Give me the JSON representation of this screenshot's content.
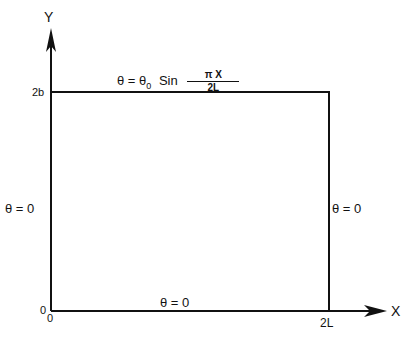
{
  "axes": {
    "x_label": "X",
    "y_label": "Y",
    "origin_label_x": "0",
    "origin_label_y": "0",
    "x_tick": "2L",
    "y_tick": "2b"
  },
  "boundary_conditions": {
    "top_lhs": "θ = θ",
    "top_lhs_sub": "0",
    "top_func": "Sin",
    "top_num": "π X",
    "top_den": "2L",
    "left": "θ = 0",
    "right": "θ = 0",
    "bottom": "θ = 0"
  },
  "colors": {
    "line": "#111111",
    "background": "#ffffff"
  }
}
